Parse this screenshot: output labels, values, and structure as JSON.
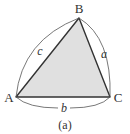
{
  "diagram": {
    "type": "triangle",
    "caption": "(a)",
    "vertices": {
      "A": {
        "label": "A",
        "x": 16,
        "y": 97
      },
      "B": {
        "label": "B",
        "x": 79,
        "y": 18
      },
      "C": {
        "label": "C",
        "x": 110,
        "y": 97
      }
    },
    "sides": {
      "a": {
        "label": "a",
        "between": [
          "B",
          "C"
        ]
      },
      "b": {
        "label": "b",
        "between": [
          "A",
          "C"
        ]
      },
      "c": {
        "label": "c",
        "between": [
          "A",
          "B"
        ]
      }
    },
    "colors": {
      "fill": "#e0e0e0",
      "edge": "#333333",
      "arc": "#555555"
    }
  }
}
